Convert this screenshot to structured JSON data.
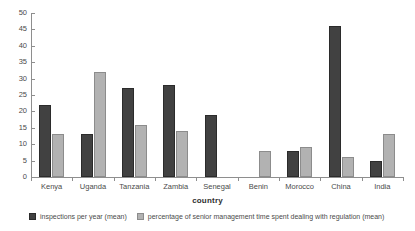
{
  "chart_data": {
    "type": "bar",
    "title": "",
    "xlabel": "country",
    "ylabel": "",
    "ylim": [
      0,
      50
    ],
    "ytick_step": 5,
    "yticks": [
      "0",
      "5",
      "10",
      "15",
      "20",
      "25",
      "30",
      "35",
      "40",
      "45",
      "50"
    ],
    "grid": false,
    "legend_position": "bottom-left",
    "categories": [
      "Kenya",
      "Uganda",
      "Tanzania",
      "Zambia",
      "Senegal",
      "Benin",
      "Morocco",
      "China",
      "India"
    ],
    "series": [
      {
        "name": "inspections per year (mean)",
        "color": "#414141",
        "values": [
          22,
          13,
          27,
          28,
          19,
          null,
          8,
          46,
          5
        ]
      },
      {
        "name": "percentage of senior management time spent dealing with regulation (mean)",
        "color": "#b2b2b2",
        "values": [
          13,
          32,
          16,
          14,
          null,
          8,
          9,
          6,
          13
        ]
      }
    ]
  },
  "legend": {
    "items": [
      {
        "label": "inspections per year (mean)",
        "swatch": "dark"
      },
      {
        "label": "percentage of senior management time spent dealing with regulation (mean)",
        "swatch": "light"
      }
    ]
  },
  "axis": {
    "x_title": "country"
  }
}
